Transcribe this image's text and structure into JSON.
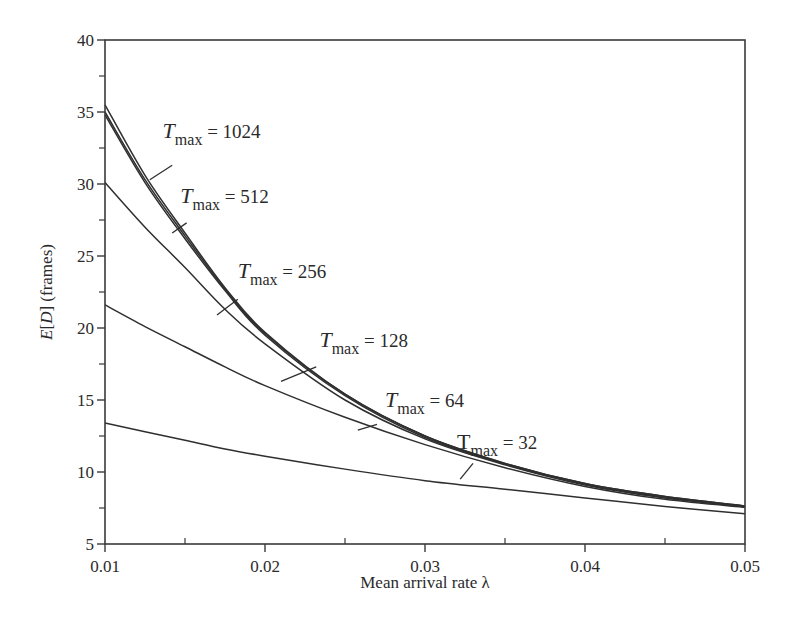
{
  "chart_data": {
    "type": "line",
    "title": "",
    "xlabel": "Mean arrival rate λ",
    "ylabel_prefix": "E",
    "ylabel_var": "D",
    "ylabel_suffix": "(frames)",
    "ylabel": "E[D] (frames)",
    "xlim": [
      0.01,
      0.05
    ],
    "ylim": [
      5,
      40
    ],
    "grid": false,
    "legend": "inline annotations",
    "x_ticks": [
      "0.01",
      "0.02",
      "0.03",
      "0.04",
      "0.05"
    ],
    "x_tick_values": [
      0.01,
      0.02,
      0.03,
      0.04,
      0.05
    ],
    "x_minor_ticks": [
      0.015,
      0.025,
      0.035,
      0.045
    ],
    "y_ticks": [
      "5",
      "10",
      "15",
      "20",
      "25",
      "30",
      "35",
      "40"
    ],
    "y_tick_values": [
      5,
      10,
      15,
      20,
      25,
      30,
      35,
      40
    ],
    "y_minor_ticks": [
      7.5,
      12.5,
      17.5,
      22.5,
      27.5,
      32.5,
      37.5
    ],
    "x": [
      0.01,
      0.0125,
      0.015,
      0.0175,
      0.02,
      0.025,
      0.03,
      0.035,
      0.04,
      0.045,
      0.05
    ],
    "series": [
      {
        "name": "T_max = 1024",
        "values": [
          35.5,
          30.6,
          26.6,
          22.8,
          19.7,
          15.4,
          12.5,
          10.6,
          9.2,
          8.3,
          7.65
        ]
      },
      {
        "name": "T_max = 512",
        "values": [
          35.0,
          30.3,
          26.4,
          22.7,
          19.6,
          15.4,
          12.5,
          10.6,
          9.2,
          8.3,
          7.65
        ]
      },
      {
        "name": "T_max = 256",
        "values": [
          34.8,
          30.1,
          26.2,
          22.6,
          19.5,
          15.3,
          12.4,
          10.55,
          9.15,
          8.25,
          7.6
        ]
      },
      {
        "name": "T_max = 128",
        "values": [
          30.1,
          27.0,
          24.2,
          21.3,
          18.9,
          15.0,
          12.3,
          10.5,
          9.1,
          8.2,
          7.6
        ]
      },
      {
        "name": "T_max = 64",
        "values": [
          21.6,
          20.1,
          18.7,
          17.3,
          16.0,
          13.8,
          11.9,
          10.3,
          9.0,
          8.1,
          7.55
        ]
      },
      {
        "name": "T_max = 32",
        "values": [
          13.4,
          12.8,
          12.2,
          11.6,
          11.1,
          10.2,
          9.4,
          8.8,
          8.2,
          7.6,
          7.1
        ]
      }
    ],
    "annotations": [
      {
        "base": "T",
        "sub": "max",
        "text": " = 1024",
        "italic": true,
        "x": 0.0136,
        "y": 33.2,
        "leader": [
          [
            0.0142,
            31.3
          ],
          [
            0.0128,
            30.3
          ]
        ]
      },
      {
        "base": "T",
        "sub": "max",
        "text": " = 512",
        "italic": true,
        "x": 0.0147,
        "y": 28.7,
        "leader": [
          [
            0.0151,
            27.3
          ],
          [
            0.0142,
            26.6
          ]
        ]
      },
      {
        "base": "T",
        "sub": "max",
        "text": " = 256",
        "italic": true,
        "x": 0.0183,
        "y": 23.5,
        "leader": [
          [
            0.0183,
            22.0
          ],
          [
            0.017,
            20.9
          ]
        ]
      },
      {
        "base": "T",
        "sub": "max",
        "text": " = 128",
        "italic": true,
        "x": 0.0234,
        "y": 18.7,
        "leader": [
          [
            0.0232,
            17.3
          ],
          [
            0.021,
            16.3
          ]
        ]
      },
      {
        "base": "T",
        "sub": "max",
        "text": " = 64",
        "italic": true,
        "x": 0.0275,
        "y": 14.5,
        "leader": [
          [
            0.027,
            13.3
          ],
          [
            0.0258,
            12.9
          ]
        ]
      },
      {
        "base": "T",
        "sub": "max",
        "text": " = 32",
        "italic": false,
        "x": 0.032,
        "y": 11.6,
        "leader": [
          [
            0.033,
            10.6
          ],
          [
            0.0322,
            9.5
          ]
        ]
      }
    ]
  },
  "plot_area": {
    "left": 105,
    "top": 40,
    "right": 745,
    "bottom": 544
  },
  "colors": {
    "line": "#2f2f2f",
    "axis": "#3a3a3a",
    "text": "#2a2a2a",
    "background": "#ffffff"
  }
}
